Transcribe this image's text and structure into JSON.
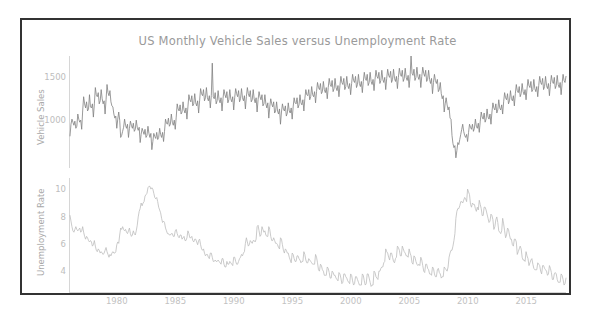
{
  "figure": {
    "title": "US Monthly Vehicle Sales versus Unemployment Rate",
    "background": "#ffffff",
    "frame_color": "#333333"
  },
  "panels": {
    "top": {
      "ylabel": "Vehicle Sales",
      "yticks": [
        "1000",
        "1500"
      ],
      "line_color": "#808080"
    },
    "bottom": {
      "ylabel": "Unemployment Rate",
      "yticks": [
        "4",
        "6",
        "8",
        "10"
      ],
      "line_color": "#bcbcbc"
    }
  },
  "xticks": [
    "1980",
    "1985",
    "1990",
    "1995",
    "2000",
    "2005",
    "2010",
    "2015"
  ],
  "chart_data": {
    "type": "line",
    "title": "US Monthly Vehicle Sales versus Unemployment Rate",
    "xlabel": "",
    "subplots": [
      {
        "name": "Vehicle Sales",
        "ylabel": "Vehicle Sales",
        "ytick_values": [
          1000,
          1500
        ],
        "ylim": [
          700,
          1800
        ],
        "xlim": [
          1976.0,
          2018.4
        ],
        "grid": false,
        "color": "#808080",
        "x_start": 1976.0,
        "x_step": 0.08333,
        "values": [
          1015,
          1130,
          1180,
          1150,
          1120,
          1160,
          1090,
          1110,
          1230,
          1180,
          1150,
          1170,
          1080,
          1260,
          1400,
          1330,
          1290,
          1350,
          1260,
          1280,
          1420,
          1300,
          1290,
          1330,
          1200,
          1330,
          1490,
          1420,
          1400,
          1440,
          1330,
          1360,
          1470,
          1380,
          1330,
          1360,
          1230,
          1370,
          1520,
          1440,
          1410,
          1460,
          1350,
          1310,
          1300,
          1230,
          1190,
          1210,
          1090,
          1180,
          1250,
          1170,
          1000,
          1020,
          1060,
          1100,
          1180,
          1120,
          1090,
          1130,
          1000,
          1090,
          1160,
          1120,
          1090,
          1140,
          1060,
          1080,
          1170,
          1100,
          1070,
          1100,
          950,
          1030,
          1090,
          1060,
          1030,
          1080,
          1000,
          1020,
          1110,
          1040,
          1000,
          1040,
          880,
          960,
          1040,
          1010,
          990,
          1050,
          980,
          1000,
          1090,
          1030,
          1000,
          1050,
          960,
          1060,
          1180,
          1140,
          1130,
          1190,
          1110,
          1130,
          1230,
          1150,
          1120,
          1170,
          1080,
          1200,
          1330,
          1280,
          1260,
          1320,
          1230,
          1250,
          1350,
          1270,
          1240,
          1290,
          1180,
          1300,
          1420,
          1370,
          1350,
          1410,
          1310,
          1330,
          1430,
          1340,
          1310,
          1360,
          1240,
          1360,
          1480,
          1430,
          1410,
          1470,
          1360,
          1390,
          1490,
          1390,
          1360,
          1410,
          1290,
          1410,
          1730,
          1400,
          1380,
          1440,
          1330,
          1360,
          1460,
          1370,
          1340,
          1390,
          1260,
          1380,
          1470,
          1420,
          1390,
          1450,
          1340,
          1370,
          1470,
          1380,
          1350,
          1400,
          1270,
          1390,
          1480,
          1430,
          1400,
          1460,
          1350,
          1380,
          1480,
          1390,
          1360,
          1410,
          1280,
          1400,
          1490,
          1430,
          1400,
          1460,
          1350,
          1370,
          1470,
          1380,
          1340,
          1390,
          1250,
          1370,
          1450,
          1400,
          1370,
          1420,
          1310,
          1330,
          1420,
          1330,
          1290,
          1340,
          1190,
          1300,
          1380,
          1330,
          1300,
          1350,
          1240,
          1260,
          1350,
          1260,
          1230,
          1280,
          1130,
          1250,
          1330,
          1280,
          1260,
          1310,
          1210,
          1240,
          1340,
          1260,
          1240,
          1290,
          1180,
          1300,
          1390,
          1340,
          1330,
          1390,
          1290,
          1320,
          1420,
          1340,
          1320,
          1370,
          1260,
          1380,
          1470,
          1420,
          1410,
          1470,
          1370,
          1400,
          1500,
          1420,
          1400,
          1450,
          1340,
          1450,
          1540,
          1490,
          1470,
          1530,
          1430,
          1450,
          1550,
          1470,
          1440,
          1490,
          1380,
          1490,
          1580,
          1520,
          1500,
          1560,
          1450,
          1480,
          1580,
          1490,
          1460,
          1510,
          1400,
          1510,
          1600,
          1540,
          1520,
          1580,
          1470,
          1500,
          1600,
          1510,
          1480,
          1530,
          1420,
          1530,
          1620,
          1560,
          1540,
          1600,
          1490,
          1520,
          1620,
          1530,
          1500,
          1550,
          1440,
          1550,
          1640,
          1580,
          1560,
          1620,
          1510,
          1540,
          1640,
          1550,
          1520,
          1570,
          1460,
          1570,
          1660,
          1600,
          1580,
          1640,
          1530,
          1560,
          1660,
          1570,
          1540,
          1590,
          1470,
          1580,
          1670,
          1610,
          1590,
          1650,
          1540,
          1570,
          1670,
          1580,
          1550,
          1600,
          1480,
          1590,
          1680,
          1620,
          1600,
          1660,
          1550,
          1580,
          1680,
          1590,
          1560,
          1610,
          1490,
          1600,
          1800,
          1630,
          1610,
          1670,
          1560,
          1590,
          1690,
          1600,
          1570,
          1620,
          1490,
          1600,
          1690,
          1630,
          1600,
          1660,
          1550,
          1570,
          1660,
          1570,
          1530,
          1580,
          1430,
          1540,
          1620,
          1560,
          1530,
          1570,
          1450,
          1470,
          1540,
          1430,
          1380,
          1410,
          1250,
          1330,
          1390,
          1320,
          1270,
          1300,
          1190,
          1180,
          1020,
          940,
          900,
          920,
          800,
          870,
          950,
          930,
          980,
          1030,
          1080,
          1130,
          1060,
          1020,
          1000,
          1030,
          960,
          1050,
          1130,
          1100,
          1080,
          1130,
          1060,
          1090,
          1180,
          1110,
          1090,
          1140,
          1050,
          1160,
          1250,
          1200,
          1180,
          1240,
          1150,
          1180,
          1280,
          1200,
          1180,
          1230,
          1130,
          1250,
          1340,
          1290,
          1270,
          1330,
          1240,
          1270,
          1370,
          1290,
          1270,
          1320,
          1230,
          1350,
          1440,
          1390,
          1370,
          1430,
          1330,
          1360,
          1460,
          1380,
          1360,
          1410,
          1310,
          1430,
          1520,
          1460,
          1440,
          1500,
          1400,
          1430,
          1530,
          1450,
          1420,
          1470,
          1370,
          1480,
          1570,
          1510,
          1490,
          1550,
          1450,
          1470,
          1570,
          1480,
          1450,
          1500,
          1400,
          1510,
          1600,
          1540,
          1520,
          1580,
          1470,
          1500,
          1600,
          1510,
          1480,
          1530,
          1410,
          1520,
          1610,
          1550,
          1530,
          1590,
          1480,
          1510,
          1610,
          1520,
          1490,
          1540,
          1420,
          1530,
          1620,
          1560,
          1540,
          1600
        ]
      },
      {
        "name": "Unemployment Rate",
        "ylabel": "Unemployment Rate",
        "ytick_values": [
          4,
          6,
          8,
          10
        ],
        "ylim": [
          3.2,
          11.4
        ],
        "xlim": [
          1976.0,
          2018.4
        ],
        "grid": false,
        "color": "#bcbcbc",
        "x_start": 1976.0,
        "x_step": 0.08333,
        "values": [
          8.7,
          8.3,
          7.9,
          7.6,
          7.5,
          7.7,
          7.9,
          7.7,
          7.6,
          7.7,
          7.8,
          7.5,
          7.6,
          7.9,
          7.5,
          7.2,
          7.0,
          7.2,
          7.1,
          6.9,
          6.8,
          6.9,
          6.8,
          6.5,
          6.6,
          6.9,
          6.5,
          6.2,
          6.1,
          6.3,
          6.2,
          6.0,
          6.1,
          6.0,
          5.9,
          6.0,
          6.2,
          6.4,
          6.1,
          5.9,
          5.7,
          5.9,
          5.8,
          6.0,
          6.1,
          6.0,
          6.0,
          6.1,
          6.6,
          6.8,
          6.7,
          7.3,
          7.8,
          7.7,
          7.9,
          7.7,
          7.6,
          7.7,
          7.5,
          7.4,
          7.6,
          7.8,
          7.4,
          7.2,
          7.3,
          7.6,
          7.4,
          7.3,
          7.6,
          8.0,
          8.6,
          9.0,
          9.2,
          9.6,
          9.4,
          9.6,
          9.7,
          10.1,
          10.2,
          10.3,
          10.7,
          10.8,
          10.8,
          10.6,
          10.7,
          10.6,
          10.3,
          10.0,
          9.9,
          10.0,
          9.7,
          9.3,
          9.1,
          8.9,
          8.5,
          8.2,
          8.3,
          8.2,
          7.8,
          7.6,
          7.4,
          7.4,
          7.3,
          7.3,
          7.4,
          7.4,
          7.2,
          7.2,
          7.6,
          7.7,
          7.4,
          7.2,
          7.1,
          7.3,
          7.3,
          7.0,
          7.1,
          7.2,
          6.9,
          6.9,
          7.1,
          7.6,
          7.4,
          7.1,
          7.1,
          7.2,
          6.9,
          6.8,
          7.0,
          7.0,
          6.8,
          6.6,
          6.9,
          7.0,
          6.6,
          6.3,
          6.2,
          6.3,
          6.0,
          5.8,
          5.9,
          5.9,
          5.7,
          5.6,
          6.0,
          6.0,
          5.7,
          5.4,
          5.4,
          5.5,
          5.4,
          5.4,
          5.5,
          5.4,
          5.3,
          5.2,
          5.6,
          5.6,
          5.2,
          5.0,
          5.0,
          5.4,
          5.2,
          5.2,
          5.4,
          5.3,
          5.2,
          5.1,
          5.7,
          5.7,
          5.4,
          5.2,
          5.2,
          5.4,
          5.6,
          5.7,
          5.9,
          5.8,
          6.0,
          6.1,
          6.7,
          7.1,
          6.8,
          6.5,
          6.6,
          6.9,
          6.8,
          6.7,
          6.9,
          6.9,
          6.8,
          7.0,
          7.9,
          8.0,
          7.6,
          7.2,
          7.3,
          7.9,
          7.7,
          7.5,
          7.6,
          7.3,
          7.2,
          7.2,
          7.9,
          7.7,
          7.2,
          6.9,
          6.9,
          7.1,
          6.9,
          6.7,
          6.7,
          6.6,
          6.4,
          6.3,
          7.1,
          7.0,
          6.6,
          6.2,
          6.0,
          6.3,
          6.2,
          6.0,
          6.0,
          5.7,
          5.5,
          5.3,
          6.0,
          5.9,
          5.6,
          5.4,
          5.4,
          5.8,
          5.8,
          5.6,
          5.5,
          5.3,
          5.4,
          5.4,
          6.1,
          5.9,
          5.5,
          5.3,
          5.3,
          5.6,
          5.5,
          5.4,
          5.3,
          5.2,
          5.2,
          5.2,
          5.9,
          5.7,
          5.3,
          4.8,
          4.7,
          5.2,
          5.1,
          4.8,
          4.7,
          4.4,
          4.4,
          4.4,
          5.0,
          4.9,
          4.6,
          4.2,
          4.2,
          4.7,
          4.6,
          4.4,
          4.4,
          4.2,
          4.1,
          4.0,
          4.6,
          4.5,
          4.2,
          3.8,
          3.9,
          4.5,
          4.5,
          4.3,
          4.2,
          4.0,
          3.9,
          3.8,
          4.5,
          4.4,
          4.0,
          3.7,
          3.8,
          4.3,
          4.3,
          4.1,
          3.9,
          3.7,
          3.7,
          3.7,
          4.5,
          4.4,
          4.0,
          3.7,
          3.8,
          4.5,
          4.5,
          4.2,
          3.9,
          3.6,
          3.7,
          3.7,
          4.7,
          4.6,
          4.3,
          4.2,
          4.1,
          4.7,
          4.7,
          4.9,
          5.0,
          5.0,
          5.3,
          5.4,
          6.3,
          6.1,
          6.0,
          5.7,
          5.5,
          6.0,
          6.0,
          5.7,
          5.4,
          5.3,
          5.6,
          5.7,
          6.5,
          6.4,
          6.2,
          5.8,
          5.8,
          6.5,
          6.3,
          6.1,
          6.0,
          5.8,
          5.8,
          5.7,
          6.3,
          6.0,
          5.8,
          5.3,
          5.2,
          5.8,
          5.7,
          5.4,
          5.2,
          5.1,
          5.2,
          5.1,
          5.7,
          5.5,
          5.1,
          4.7,
          4.6,
          5.2,
          5.2,
          4.9,
          4.8,
          4.5,
          4.5,
          4.4,
          5.0,
          4.9,
          4.5,
          4.3,
          4.3,
          4.8,
          4.9,
          4.6,
          4.5,
          4.2,
          4.3,
          4.3,
          5.0,
          4.9,
          4.8,
          4.7,
          5.0,
          5.7,
          6.0,
          6.2,
          6.2,
          6.5,
          6.9,
          7.4,
          8.5,
          9.0,
          9.2,
          9.2,
          9.4,
          9.7,
          9.7,
          9.6,
          9.8,
          10.0,
          9.9,
          9.7,
          10.6,
          10.4,
          10.2,
          9.5,
          9.3,
          9.6,
          9.5,
          9.5,
          9.2,
          9.0,
          9.3,
          9.1,
          9.8,
          9.5,
          9.2,
          8.7,
          8.7,
          9.3,
          9.3,
          9.1,
          8.8,
          8.5,
          8.2,
          8.3,
          8.8,
          8.7,
          8.4,
          7.7,
          7.9,
          8.4,
          8.6,
          8.2,
          7.6,
          7.5,
          7.4,
          7.6,
          8.5,
          8.1,
          7.6,
          7.1,
          7.3,
          7.8,
          7.7,
          7.3,
          7.0,
          7.0,
          6.6,
          6.5,
          7.0,
          7.0,
          6.8,
          5.9,
          6.1,
          6.3,
          6.5,
          6.3,
          5.7,
          5.5,
          5.5,
          5.4,
          6.1,
          5.8,
          5.6,
          5.1,
          5.3,
          5.5,
          5.6,
          5.2,
          4.9,
          4.8,
          4.8,
          4.8,
          5.3,
          5.2,
          5.1,
          4.7,
          4.5,
          5.1,
          5.1,
          4.9,
          4.8,
          4.7,
          4.4,
          4.5,
          5.1,
          4.9,
          4.6,
          4.1,
          4.1,
          4.5,
          4.6,
          4.5,
          4.1,
          3.9,
          3.9,
          3.9,
          4.5,
          4.4,
          4.1,
          3.7,
          3.8,
          4.2
        ]
      }
    ]
  }
}
